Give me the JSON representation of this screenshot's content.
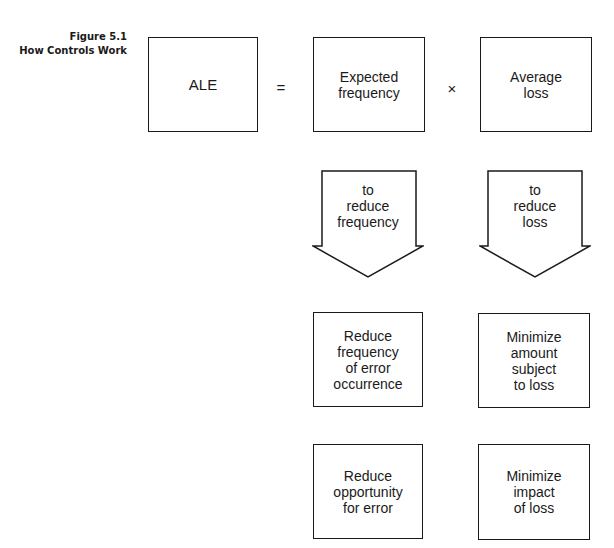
{
  "figure": {
    "number": "Figure 5.1",
    "title": "How Controls Work"
  },
  "equation": {
    "lhs": "ALE",
    "equals": "=",
    "factor1": "Expected\nfrequency",
    "times": "×",
    "factor2": "Average\nloss"
  },
  "arrows": [
    {
      "label": "to\nreduce\nfrequency"
    },
    {
      "label": "to\nreduce\nloss"
    }
  ],
  "controls": {
    "frequency": [
      "Reduce\nfrequency\nof error\noccurrence",
      "Reduce\nopportunity\nfor error"
    ],
    "loss": [
      "Minimize\namount\nsubject\nto loss",
      "Minimize\nimpact\nof loss"
    ]
  },
  "colors": {
    "ink": "#1a1a1a",
    "background": "#ffffff"
  }
}
